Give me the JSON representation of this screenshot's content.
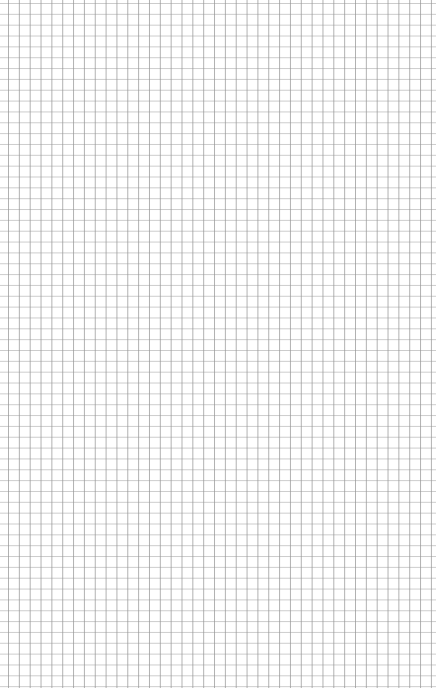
{
  "page": {
    "type": "blank-grid-paper",
    "background_color": "#ffffff",
    "grid_line_color": "#999999",
    "grid_spacing_px": 10.85
  }
}
